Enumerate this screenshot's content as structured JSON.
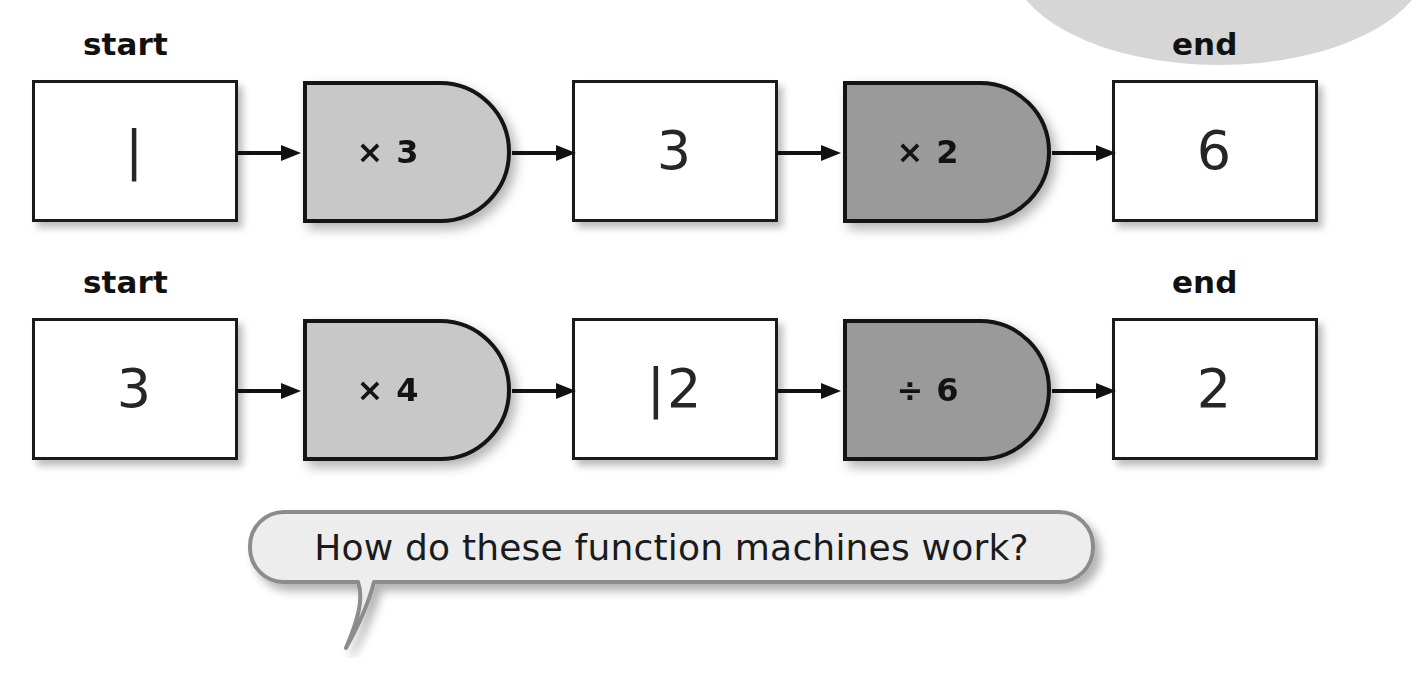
{
  "colors": {
    "page_background": "#ffffff",
    "machine_light": "#c8c8c8",
    "machine_dark": "#9a9a9a",
    "outline": "#1a1a1a",
    "bubble_fill": "#ededed",
    "bubble_border": "#8c8c8c",
    "corner_ellipse": "#d6d6d6",
    "text": "#1b1b1b"
  },
  "labels": {
    "start": "start",
    "end": "end"
  },
  "speech_bubble": {
    "text": "How do these function machines work?"
  },
  "chains": [
    {
      "id": "chain-1",
      "start_label": "start",
      "end_label": "end",
      "nodes": [
        {
          "kind": "value",
          "value": "|",
          "reads_as": "1"
        },
        {
          "kind": "machine",
          "operation": "× 3",
          "shade": "light"
        },
        {
          "kind": "value",
          "value": "3",
          "reads_as": "3"
        },
        {
          "kind": "machine",
          "operation": "× 2",
          "shade": "dark"
        },
        {
          "kind": "value",
          "value": "6",
          "reads_as": "6"
        }
      ]
    },
    {
      "id": "chain-2",
      "start_label": "start",
      "end_label": "end",
      "nodes": [
        {
          "kind": "value",
          "value": "3",
          "reads_as": "3"
        },
        {
          "kind": "machine",
          "operation": "× 4",
          "shade": "light"
        },
        {
          "kind": "value",
          "value": "|2",
          "reads_as": "12"
        },
        {
          "kind": "machine",
          "operation": "÷ 6",
          "shade": "dark"
        },
        {
          "kind": "value",
          "value": "2",
          "reads_as": "2"
        }
      ]
    }
  ]
}
